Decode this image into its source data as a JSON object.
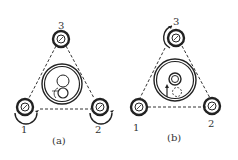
{
  "figure": {
    "panels": [
      {
        "id": "a",
        "caption": "(a)",
        "rollers": [
          {
            "label": "1",
            "role": "bottom-left roller",
            "rotation_arrow": "below"
          },
          {
            "label": "2",
            "role": "bottom-right roller",
            "rotation_arrow": "below"
          },
          {
            "label": "3",
            "role": "top roller",
            "rotation_arrow": "none"
          }
        ],
        "center": "large ring with two stacked small circles and a partial circle at lower left"
      },
      {
        "id": "b",
        "caption": "(b)",
        "rollers": [
          {
            "label": "1",
            "role": "bottom-left roller",
            "rotation_arrow": "none"
          },
          {
            "label": "2",
            "role": "bottom-right roller",
            "rotation_arrow": "none"
          },
          {
            "label": "3",
            "role": "top roller",
            "rotation_arrow": "left side"
          }
        ],
        "center": "large ring with small centered ring, upward arrow and dashed circle below"
      }
    ],
    "colors": {
      "ink": "#222222",
      "background": "#ffffff"
    }
  }
}
